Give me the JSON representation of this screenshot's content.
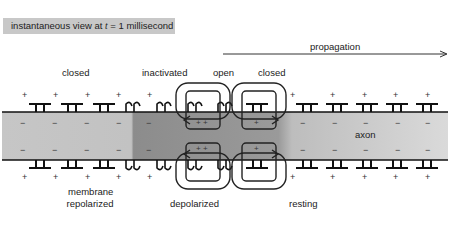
{
  "header": {
    "prefix": "instantaneous view at ",
    "var": "t",
    "suffix": " = 1 millisecond"
  },
  "arrow": {
    "label": "propagation",
    "direction": "right"
  },
  "channel_states": {
    "closed_left": "closed",
    "inactivated": "inactivated",
    "open": "open",
    "closed_right": "closed"
  },
  "axon_label": "axon",
  "regions": {
    "repolarized_line1": "membrane",
    "repolarized_line2": "repolarized",
    "depolarized": "depolarized",
    "resting": "resting"
  },
  "colors": {
    "repolarized_fill": "#c4c4c4",
    "inactivated_fill": "#8e8e8e",
    "depolarized_fill": "#9a9a9a",
    "resting_fill": "#d4d4d4",
    "badge_bg": "#c8c8c8"
  },
  "charges": {
    "outside": "+",
    "inside": "−",
    "reversed_inside": "+ +"
  }
}
